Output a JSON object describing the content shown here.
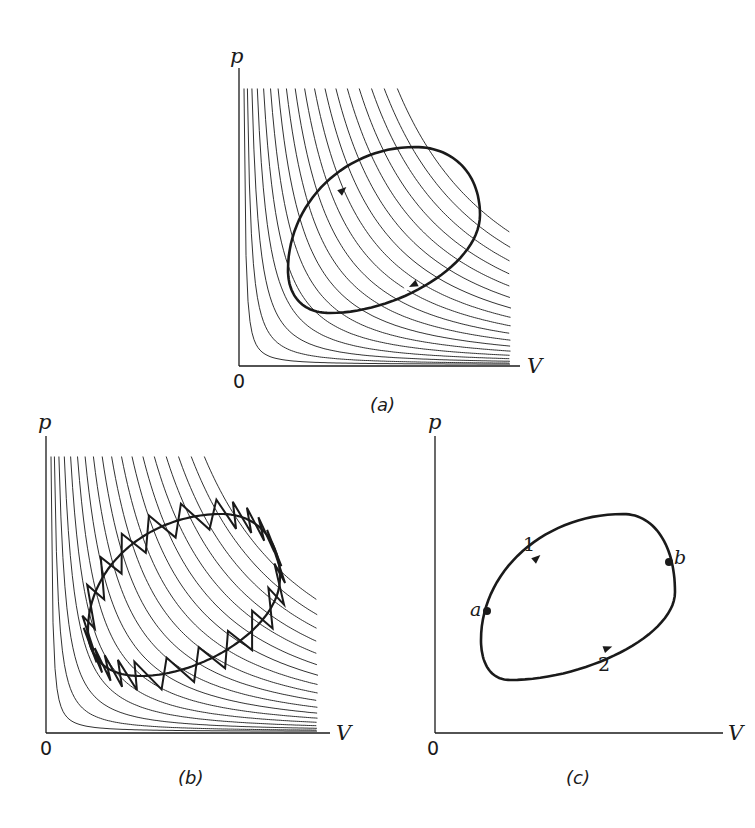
{
  "figure": {
    "colors": {
      "ink": "#1a1a1a",
      "background": "#ffffff"
    },
    "panels": [
      {
        "id": "a",
        "caption": "(a)",
        "y_axis_label": "p",
        "x_axis_label": "V",
        "origin_label": "0",
        "description": "Family of adiabats with a reversible cyclic process drawn as a smooth closed loop traversed clockwise",
        "axes": {
          "x0": 239,
          "y0": 366,
          "x_end": 520,
          "y_top": 68
        },
        "curves": {
          "count": 18,
          "x_right": 511,
          "y_top": 90
        },
        "loop": {
          "cx": 384,
          "cy": 230,
          "top": [
            415,
            147
          ],
          "right": [
            480,
            215
          ],
          "bottom": [
            330,
            313
          ],
          "left": [
            288,
            270
          ]
        },
        "arrows": [
          {
            "at": [
              343,
              190
            ],
            "dir": "up-right"
          },
          {
            "at": [
              413,
              285
            ],
            "dir": "down-left"
          }
        ],
        "labels": {
          "p": [
            230,
            46
          ],
          "V": [
            527,
            356
          ],
          "origin": [
            233,
            372
          ],
          "caption": [
            370,
            396
          ]
        }
      },
      {
        "id": "b",
        "caption": "(b)",
        "y_axis_label": "p",
        "x_axis_label": "V",
        "origin_label": "0",
        "description": "Same cycle approximated by a zigzag of alternating adiabatic and isothermal segments",
        "axes": {
          "x0": 46,
          "y0": 733,
          "x_end": 330,
          "y_top": 436
        },
        "curves": {
          "count": 18,
          "x_right": 318,
          "y_top": 458
        },
        "loop": {
          "top": [
            222,
            514
          ],
          "right": [
            280,
            578
          ],
          "bottom": [
            140,
            676
          ],
          "left": [
            88,
            630
          ]
        },
        "zigzag": {
          "teeth": 24,
          "amplitude": 16
        },
        "labels": {
          "p": [
            38,
            412
          ],
          "V": [
            336,
            723
          ],
          "origin": [
            40,
            739
          ],
          "caption": [
            178,
            769
          ]
        }
      },
      {
        "id": "c",
        "caption": "(c)",
        "y_axis_label": "p",
        "x_axis_label": "V",
        "origin_label": "0",
        "description": "Arbitrary cycle split at states a and b into path 1 (upper) and path 2 (lower)",
        "axes": {
          "x0": 435,
          "y0": 733,
          "x_end": 723,
          "y_top": 436
        },
        "loop": {
          "top": [
            623,
            514
          ],
          "right": [
            675,
            592
          ],
          "bottom": [
            510,
            680
          ],
          "left": [
            481,
            640
          ]
        },
        "points": [
          {
            "name": "a",
            "at": [
              487,
              611
            ],
            "label_at": [
              470,
              600
            ]
          },
          {
            "name": "b",
            "at": [
              669,
              562
            ],
            "label_at": [
              674,
              548
            ]
          }
        ],
        "paths": [
          {
            "name": "1",
            "arrow_at": [
              537,
              558
            ],
            "label_at": [
              523,
              535
            ]
          },
          {
            "name": "2",
            "arrow_at": [
              608,
              648
            ],
            "label_at": [
              598,
              655
            ]
          }
        ],
        "labels": {
          "p": [
            428,
            412
          ],
          "V": [
            728,
            723
          ],
          "origin": [
            427,
            739
          ],
          "caption": [
            566,
            769
          ]
        }
      }
    ]
  }
}
